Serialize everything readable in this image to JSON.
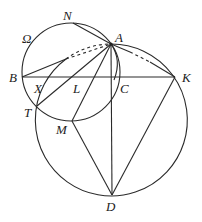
{
  "diagram": {
    "type": "geometry",
    "labels": {
      "omega": "Ω",
      "N": "N",
      "A": "A",
      "B": "B",
      "K": "K",
      "X": "X",
      "L": "L",
      "C": "C",
      "T": "T",
      "M": "M",
      "D": "D"
    },
    "points": {
      "A": [
        111,
        44
      ],
      "N": [
        73,
        23
      ],
      "B": [
        22,
        77
      ],
      "K": [
        175,
        77
      ],
      "C": [
        111,
        77
      ],
      "X": [
        42,
        77
      ],
      "L": [
        72,
        77
      ],
      "T": [
        37,
        106
      ],
      "M": [
        72,
        121
      ],
      "D": [
        112,
        195
      ],
      "P": [
        66,
        59
      ]
    },
    "circles": [
      {
        "name": "Omega",
        "center": [
          71,
          72
        ],
        "r": 49
      },
      {
        "name": "circumcircle-AKD",
        "center": [
          112,
          120
        ],
        "r": 76
      }
    ],
    "segments": [
      [
        "N",
        "A"
      ],
      [
        "B",
        "K"
      ],
      [
        "B",
        "P"
      ],
      [
        "A",
        "T"
      ],
      [
        "A",
        "M"
      ],
      [
        "A",
        "D"
      ],
      [
        "A",
        "K"
      ],
      [
        "M",
        "D"
      ],
      [
        "D",
        "K"
      ]
    ],
    "dashed_segments": [
      [
        "P",
        "A"
      ]
    ],
    "stroke_color": "#2a2a2a"
  }
}
